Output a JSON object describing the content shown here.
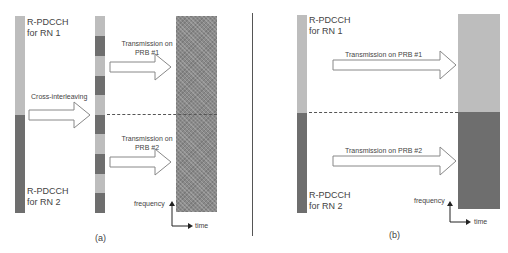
{
  "panel_a": {
    "caption": "(a)",
    "rn1_label_line1": "R-PDCCH",
    "rn1_label_line2": "for RN 1",
    "rn2_label_line1": "R-PDCCH",
    "rn2_label_line2": "for RN 2",
    "interleave_label": "Cross-interleaving",
    "tx1_line1": "Transmission on",
    "tx1_line2": "PRB #1",
    "tx2_line1": "Transmission on",
    "tx2_line2": "PRB #2",
    "axis_y": "frequency",
    "axis_x": "time"
  },
  "panel_b": {
    "caption": "(b)",
    "rn1_label_line1": "R-PDCCH",
    "rn1_label_line2": "for RN 1",
    "rn2_label_line1": "R-PDCCH",
    "rn2_label_line2": "for RN 2",
    "tx1": "Transmission on PRB #1",
    "tx2": "Transmission on PRB #2",
    "axis_y": "frequency",
    "axis_x": "time"
  },
  "colors": {
    "rn1": "#bdbdbd",
    "rn2": "#6e6e6e",
    "interleaved_block": "#8a8a8a",
    "divider": "#555555"
  }
}
